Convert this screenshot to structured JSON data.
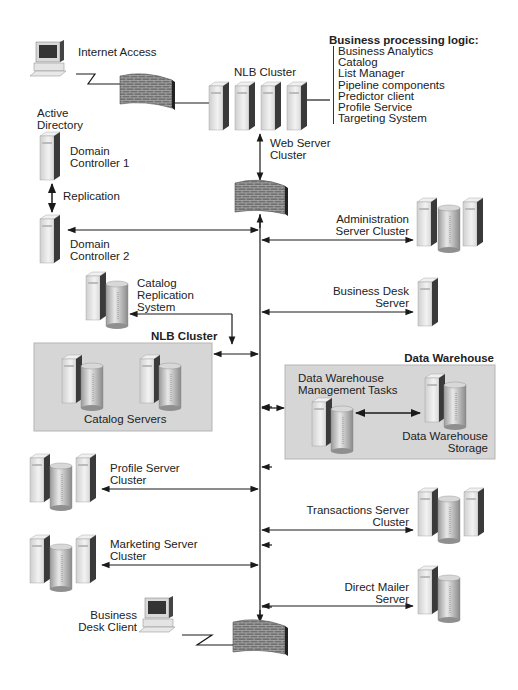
{
  "diagram": {
    "type": "network-architecture",
    "business_logic": {
      "title": "Business processing logic:",
      "items": [
        "Business Analytics",
        "Catalog",
        "List Manager",
        "Pipeline components",
        "Predictor client",
        "Profile Service",
        "Targeting System"
      ]
    },
    "nodes": {
      "internet_access": "Internet Access",
      "nlb_cluster_top": "NLB Cluster",
      "web_server_cluster": [
        "Web Server",
        "Cluster"
      ],
      "active_directory": [
        "Active",
        "Directory"
      ],
      "domain_controller_1": [
        "Domain",
        "Controller 1"
      ],
      "replication": "Replication",
      "domain_controller_2": [
        "Domain",
        "Controller 2"
      ],
      "administration_server_cluster": [
        "Administration",
        "Server Cluster"
      ],
      "catalog_replication_system": [
        "Catalog",
        "Replication",
        "System"
      ],
      "business_desk_server": [
        "Business Desk",
        "Server"
      ],
      "nlb_cluster_catalog": "NLB Cluster",
      "catalog_servers": "Catalog Servers",
      "data_warehouse": "Data Warehouse",
      "dw_management_tasks": [
        "Data Warehouse",
        "Management Tasks"
      ],
      "dw_storage": [
        "Data Warehouse",
        "Storage"
      ],
      "profile_server_cluster": [
        "Profile Server",
        "Cluster"
      ],
      "transactions_server_cluster": [
        "Transactions Server",
        "Cluster"
      ],
      "marketing_server_cluster": [
        "Marketing Server",
        "Cluster"
      ],
      "direct_mailer_server": [
        "Direct Mailer",
        "Server"
      ],
      "business_desk_client": [
        "Business",
        "Desk Client"
      ]
    },
    "colors": {
      "line": "#1a1a1a",
      "group_fill": "#d6d6d6",
      "firewall": "#6b6b6b",
      "server_light": "#e6e6e6",
      "server_dark": "#3a3a3a"
    }
  }
}
